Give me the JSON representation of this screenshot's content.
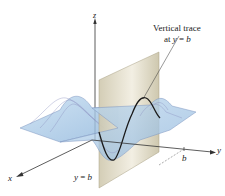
{
  "figure": {
    "annotation": {
      "line1": "Vertical trace",
      "line2_prefix": "at ",
      "line2_var": "y",
      "line2_eq": " = ",
      "line2_val": "b"
    },
    "axes": {
      "x": "x",
      "y": "y",
      "z": "z"
    },
    "tick_label_y": "b",
    "plane_label": {
      "var": "y",
      "eq": " = ",
      "val": "b"
    },
    "colors": {
      "surface_fill": "#a9cbe8",
      "surface_lines": "#7f8fb8",
      "plane_fill": "#d9d3bd",
      "trace_curve": "#1a1a1a",
      "axis": "#333333"
    }
  }
}
